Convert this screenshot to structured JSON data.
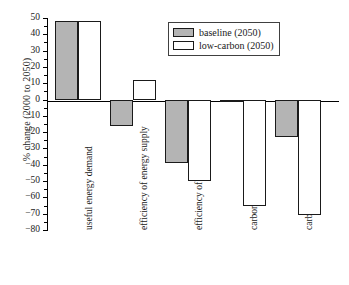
{
  "chart_data": {
    "type": "bar",
    "title": "",
    "xlabel": "",
    "ylabel": "% change (2000 to 2050)",
    "ylim": [
      -80,
      50
    ],
    "ytick_step": 10,
    "grid": false,
    "legend_position": "top-right",
    "categories": [
      "useful energy demand",
      "efficiency of energy supply",
      "efficiency of energy use",
      "carbon intensity of energy use",
      "carbon emissions"
    ],
    "series": [
      {
        "name": "baseline (2050)",
        "color": "#b4b4b4",
        "values": [
          48,
          -16,
          -39,
          -1.5,
          -23
        ]
      },
      {
        "name": "low-carbon (2050)",
        "color": "#ffffff",
        "values": [
          48,
          12,
          -50,
          -65,
          -71
        ]
      }
    ],
    "ytick_labels": [
      "50",
      "40",
      "30",
      "20",
      "10",
      "0",
      "−10",
      "−20",
      "−30",
      "−40",
      "−50",
      "−60",
      "−70",
      "−80"
    ],
    "ytick_values": [
      50,
      40,
      30,
      20,
      10,
      0,
      -10,
      -20,
      -30,
      -40,
      -50,
      -60,
      -70,
      -80
    ]
  },
  "legend": {
    "items": [
      {
        "label": "baseline (2050)",
        "swatch": "gray-filled-swatch"
      },
      {
        "label": "low-carbon (2050)",
        "swatch": "white-empty-swatch"
      }
    ]
  }
}
